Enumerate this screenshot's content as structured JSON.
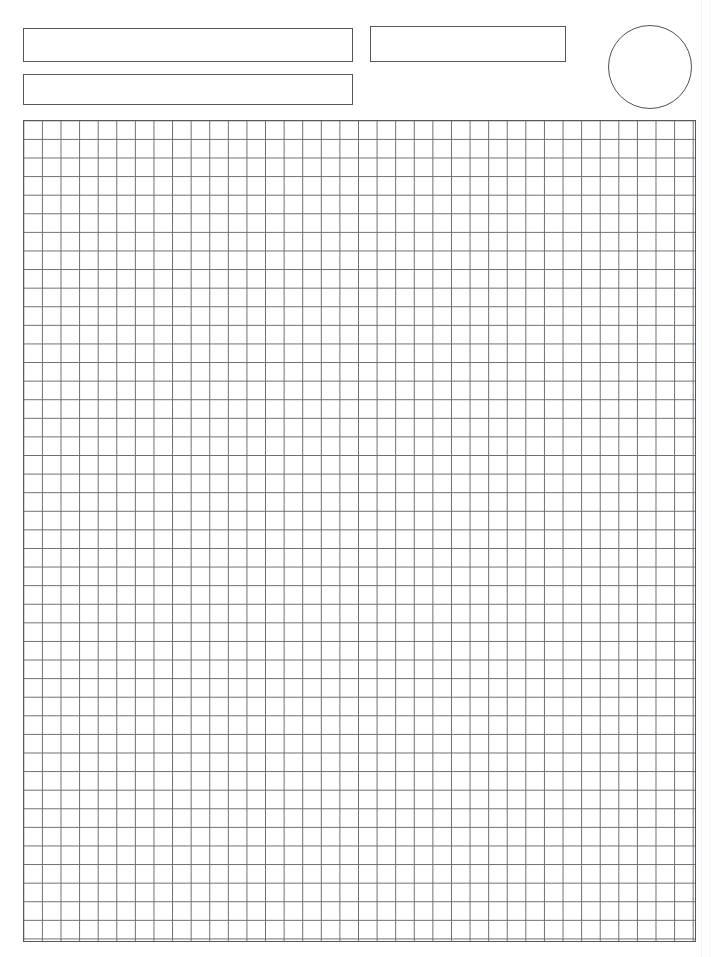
{
  "document": {
    "type": "blank-graph-paper-form",
    "page_width": 715,
    "page_height": 957,
    "background_color": "#ffffff",
    "ink_color": "#55595e"
  },
  "header": {
    "title_field": {
      "label": "title-field",
      "value": "",
      "placeholder": ""
    },
    "subtitle_field": {
      "label": "subtitle-field",
      "value": "",
      "placeholder": ""
    },
    "secondary_field": {
      "label": "secondary-field",
      "value": "",
      "placeholder": ""
    },
    "stamp": {
      "label": "stamp-circle",
      "value": "",
      "shape": "circle",
      "diameter": 84
    }
  },
  "grid": {
    "label": "graph-paper-grid",
    "columns": 36,
    "rows": 44,
    "cell_size": 18.6,
    "line_color": "#6a6e73",
    "border_color": "#55595e",
    "fill_color": "#ffffff"
  }
}
